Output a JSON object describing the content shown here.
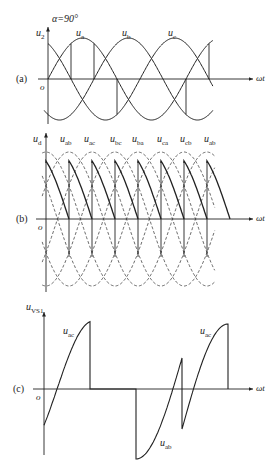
{
  "chart_data": {
    "type": "line",
    "title": "",
    "panels": [
      {
        "id": "a",
        "label": "(a)",
        "ylabel": "u2",
        "xlabel": "ωt",
        "origin_label": "o",
        "annotation": "α=90°",
        "series": [
          {
            "name": "ua",
            "phase_deg": 0
          },
          {
            "name": "ub",
            "phase_deg": -120
          },
          {
            "name": "uc",
            "phase_deg": 120
          }
        ],
        "firing_angle_deg": 90
      },
      {
        "id": "b",
        "label": "(b)",
        "ylabel": "ud",
        "xlabel": "ωt",
        "origin_label": "o",
        "series_labels": [
          "uab",
          "uac",
          "ubc",
          "uba",
          "uca",
          "ucb",
          "uab"
        ],
        "style": "line-voltages dashed, output ud solid sawtooth segments"
      },
      {
        "id": "c",
        "label": "(c)",
        "ylabel": "uVS1",
        "xlabel": "ωt",
        "origin_label": "o",
        "curve_labels": [
          "uac",
          "uab",
          "uac"
        ]
      }
    ]
  },
  "labels": {
    "alpha": "α=90°",
    "a": {
      "panel": "(a)",
      "y": "u",
      "ysub": "2",
      "x": "ωt",
      "o": "o",
      "ua": "u",
      "ua_sub": "a",
      "ub": "u",
      "ub_sub": "b",
      "uc": "u",
      "uc_sub": "c"
    },
    "b": {
      "panel": "(b)",
      "y": "u",
      "ysub": "d",
      "x": "ωt",
      "o": "o",
      "s": [
        {
          "u": "u",
          "sub": "ab"
        },
        {
          "u": "u",
          "sub": "ac"
        },
        {
          "u": "u",
          "sub": "bc"
        },
        {
          "u": "u",
          "sub": "ba"
        },
        {
          "u": "u",
          "sub": "ca"
        },
        {
          "u": "u",
          "sub": "cb"
        },
        {
          "u": "u",
          "sub": "ab"
        }
      ]
    },
    "c": {
      "panel": "(c)",
      "y": "u",
      "ysub": "VS1",
      "x": "ωt",
      "o": "o",
      "uac1": "u",
      "uac1_sub": "ac",
      "uab": "u",
      "uab_sub": "ab",
      "uac2": "u",
      "uac2_sub": "ac"
    }
  }
}
